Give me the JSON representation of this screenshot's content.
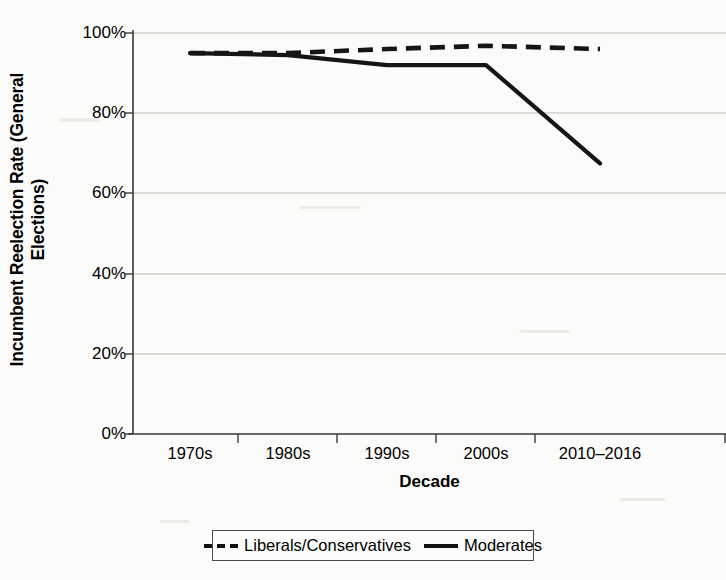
{
  "chart_data": {
    "type": "line",
    "title": "",
    "xlabel": "Decade",
    "ylabel": "Incumbent Reelection Rate (General Elections)",
    "ylabel_line1": "Incumbent Reelection Rate (General",
    "ylabel_line2": "Elections)",
    "categories": [
      "1970s",
      "1980s",
      "1990s",
      "2000s",
      "2010–2016"
    ],
    "yticks": [
      "0%",
      "20%",
      "40%",
      "60%",
      "80%",
      "100%"
    ],
    "ytick_values": [
      0,
      20,
      40,
      60,
      80,
      100
    ],
    "ylim": [
      0,
      100
    ],
    "grid": true,
    "legend_position": "bottom",
    "series": [
      {
        "name": "Liberals/Conservatives",
        "style": "dashed",
        "color": "#111111",
        "values": [
          95,
          95,
          96,
          96.8,
          96
        ]
      },
      {
        "name": "Moderates",
        "style": "solid",
        "color": "#111111",
        "values": [
          95,
          94.5,
          92,
          92,
          67.5
        ]
      }
    ]
  },
  "legend": {
    "items": [
      {
        "label": "Liberals/Conservatives",
        "style": "dashed"
      },
      {
        "label": "Moderates",
        "style": "solid"
      }
    ]
  }
}
